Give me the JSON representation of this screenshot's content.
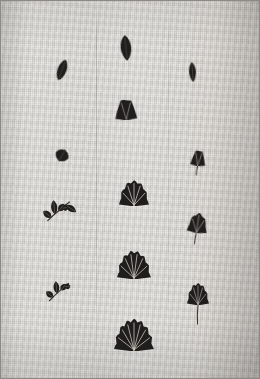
{
  "image": {
    "title": "Photographic plate of botanical specimens on woven cloth",
    "caption": "Developmental series of fan-shaped (ginkgo-like) leaves arranged in three vertical columns on a linen background",
    "medium": "black-and-white photographic print",
    "background_label": "woven linen cloth",
    "colors": {
      "cloth_light": "#e7e5e0",
      "cloth_mid": "#dedcd7",
      "cloth_shadow": "#d0cdc7",
      "specimen_dark": "#201e1c",
      "vein_light": "#cfcac2",
      "frame": "#8d8a85"
    },
    "columns": [
      {
        "name": "left-column",
        "label": "Column 1 — bud and compound-leaf stages"
      },
      {
        "name": "center-column",
        "label": "Column 2 — expanding fan-leaf series"
      },
      {
        "name": "right-column",
        "label": "Column 3 — petiolate fan-leaf series"
      }
    ],
    "specimens": [
      {
        "id": "c2-s1",
        "column": "center-column",
        "stage": 1,
        "form": "narrow bud",
        "x": 126,
        "y": 48,
        "w": 14,
        "h": 26,
        "rot": -6,
        "lobes": 0,
        "stalk": false
      },
      {
        "id": "c1-s1",
        "column": "left-column",
        "stage": 1,
        "form": "narrow bud",
        "x": 62,
        "y": 70,
        "w": 12,
        "h": 22,
        "rot": 20,
        "lobes": 0,
        "stalk": false
      },
      {
        "id": "c3-s1",
        "column": "right-column",
        "stage": 1,
        "form": "narrow bud",
        "x": 192,
        "y": 72,
        "w": 9,
        "h": 20,
        "rot": -4,
        "lobes": 0,
        "stalk": false
      },
      {
        "id": "c2-s2",
        "column": "center-column",
        "stage": 2,
        "form": "ovate leaf",
        "x": 126,
        "y": 108,
        "w": 22,
        "h": 24,
        "rot": -2,
        "lobes": 3,
        "stalk": false
      },
      {
        "id": "c1-s2",
        "column": "left-column",
        "stage": 2,
        "form": "folded leaflet",
        "x": 62,
        "y": 155,
        "w": 18,
        "h": 13,
        "rot": 28,
        "lobes": 0,
        "stalk": false
      },
      {
        "id": "c3-s2",
        "column": "right-column",
        "stage": 2,
        "form": "small fan, stalked",
        "x": 198,
        "y": 157,
        "w": 15,
        "h": 18,
        "rot": 6,
        "lobes": 3,
        "stalk": true
      },
      {
        "id": "c2-s3",
        "column": "center-column",
        "stage": 3,
        "form": "fan leaf",
        "x": 134,
        "y": 192,
        "w": 30,
        "h": 28,
        "rot": 0,
        "lobes": 6,
        "stalk": false
      },
      {
        "id": "c1-s3",
        "column": "left-column",
        "stage": 3,
        "form": "compound leaf",
        "x": 62,
        "y": 208,
        "w": 34,
        "h": 30,
        "rot": 0,
        "lobes": 5,
        "stalk": true
      },
      {
        "id": "c3-s3",
        "column": "right-column",
        "stage": 3,
        "form": "fan leaf, stalked",
        "x": 198,
        "y": 222,
        "w": 20,
        "h": 22,
        "rot": 8,
        "lobes": 4,
        "stalk": true
      },
      {
        "id": "c2-s4",
        "column": "center-column",
        "stage": 4,
        "form": "broad fan leaf",
        "x": 134,
        "y": 263,
        "w": 34,
        "h": 31,
        "rot": 0,
        "lobes": 7,
        "stalk": false
      },
      {
        "id": "c1-s4",
        "column": "left-column",
        "stage": 4,
        "form": "compound leaf",
        "x": 62,
        "y": 289,
        "w": 30,
        "h": 28,
        "rot": 0,
        "lobes": 4,
        "stalk": true
      },
      {
        "id": "c3-s4",
        "column": "right-column",
        "stage": 4,
        "form": "fan leaf, long stalk",
        "x": 198,
        "y": 293,
        "w": 22,
        "h": 24,
        "rot": 0,
        "lobes": 6,
        "stalk": true
      },
      {
        "id": "c2-s5",
        "column": "center-column",
        "stage": 5,
        "form": "largest fan leaf",
        "x": 134,
        "y": 333,
        "w": 40,
        "h": 35,
        "rot": 0,
        "lobes": 8,
        "stalk": false
      }
    ]
  }
}
